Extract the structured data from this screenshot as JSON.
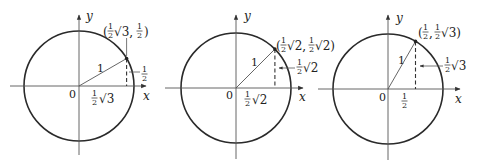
{
  "figure": {
    "panels": [
      {
        "id": "angle-30",
        "y_axis_label": "y",
        "x_axis_label": "x",
        "origin_label": "0",
        "radius_label": "1",
        "point_label": "(½√3, ½)",
        "x_coord_label": "½√3",
        "y_coord_label": "½"
      },
      {
        "id": "angle-45",
        "y_axis_label": "y",
        "x_axis_label": "x",
        "origin_label": "0",
        "radius_label": "1",
        "point_label": "(½√2, ½√2)",
        "x_coord_label": "½√2",
        "y_coord_label": "½√2"
      },
      {
        "id": "angle-60",
        "y_axis_label": "y",
        "x_axis_label": "x",
        "origin_label": "0",
        "radius_label": "1",
        "point_label": "(½, ½√3)",
        "x_coord_label": "½",
        "y_coord_label": "½√3"
      }
    ]
  }
}
